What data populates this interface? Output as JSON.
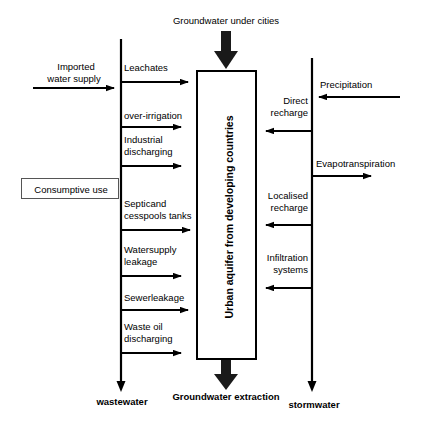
{
  "diagram": {
    "center_box": {
      "label": "Urban aquifer from developing countries"
    },
    "consumptive_box": {
      "label": "Consumptive use"
    },
    "top_inflow": {
      "label": "Groundwater under cities"
    },
    "bottom_outflow": {
      "label": "Groundwater extraction"
    },
    "left_source": {
      "label_line1": "Imported",
      "label_line2": "water supply"
    },
    "right_source": {
      "label": "Precipitation"
    },
    "left_outlet": {
      "label": "wastewater"
    },
    "right_outlet": {
      "label": "stormwater"
    },
    "evapotranspiration": {
      "label": "Evapotranspiration"
    },
    "left_flows": [
      {
        "label_line1": "Leachates",
        "label_line2": ""
      },
      {
        "label_line1": "over-irrigation",
        "label_line2": ""
      },
      {
        "label_line1": "Industrial",
        "label_line2": "discharging"
      },
      {
        "label_line1": "Septicand",
        "label_line2": "cesspools tanks"
      },
      {
        "label_line1": "Watersupply",
        "label_line2": "leakage"
      },
      {
        "label_line1": "Sewerleakage",
        "label_line2": ""
      },
      {
        "label_line1": "Waste oil",
        "label_line2": "discharging"
      }
    ],
    "right_flows": [
      {
        "label_line1": "Direct",
        "label_line2": "recharge"
      },
      {
        "label_line1": "Localised",
        "label_line2": "recharge"
      },
      {
        "label_line1": "Infiltration",
        "label_line2": "systems"
      }
    ],
    "colors": {
      "stroke": "#000000",
      "box_border_light": "#555555",
      "background": "#ffffff"
    }
  }
}
